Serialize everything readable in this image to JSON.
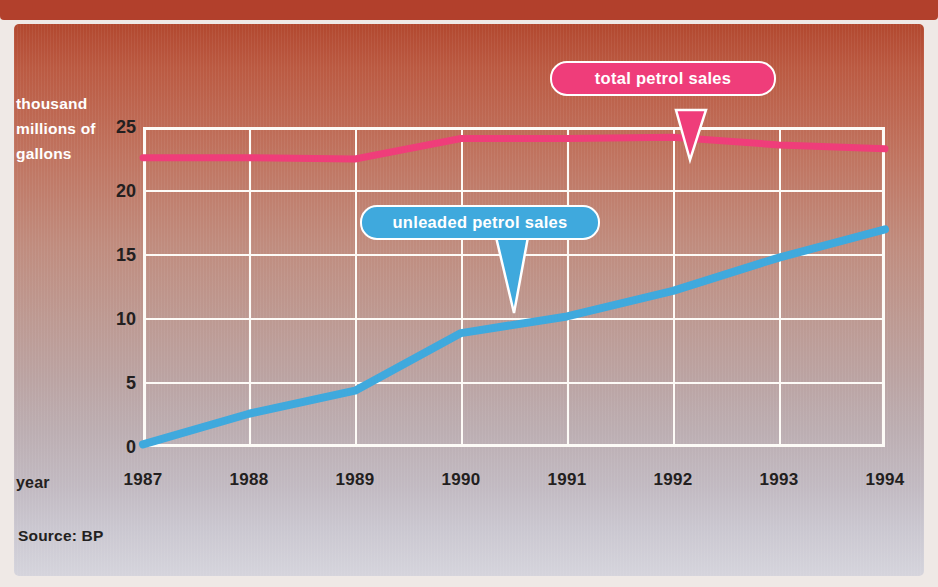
{
  "header": {
    "title": "Petrol sales: total and unleaded",
    "banner_color": "#b2402c"
  },
  "axes": {
    "y_title": [
      "thousand",
      "millions of",
      "gallons"
    ],
    "y_ticks": [
      "0",
      "5",
      "10",
      "15",
      "20",
      "25"
    ],
    "x_title": "year",
    "x_ticks": [
      "1987",
      "1988",
      "1989",
      "1990",
      "1991",
      "1992",
      "1993",
      "1994"
    ]
  },
  "callouts": {
    "total": {
      "label": "total petrol sales",
      "color": "#ef3d7a"
    },
    "unleaded": {
      "label": "unleaded petrol sales",
      "color": "#3fa9dd"
    }
  },
  "footer": {
    "source": "Source: BP"
  },
  "chart_data": {
    "type": "line",
    "title": "Petrol sales: total and unleaded",
    "xlabel": "year",
    "ylabel": "thousand millions of gallons",
    "x": [
      1987,
      1988,
      1989,
      1990,
      1991,
      1992,
      1993,
      1994
    ],
    "xlim": [
      1987,
      1994
    ],
    "ylim": [
      0,
      25
    ],
    "yticks": [
      0,
      5,
      10,
      15,
      20,
      25
    ],
    "grid": true,
    "legend": "callout-labels",
    "series": [
      {
        "name": "total petrol sales",
        "color": "#ef3d7a",
        "values": [
          22.6,
          22.6,
          22.5,
          24.1,
          24.1,
          24.2,
          23.6,
          23.3
        ]
      },
      {
        "name": "unleaded petrol sales",
        "color": "#3fa9dd",
        "values": [
          0.2,
          2.6,
          4.4,
          8.9,
          10.2,
          12.2,
          14.8,
          17.0
        ]
      }
    ],
    "source": "Source: BP"
  }
}
